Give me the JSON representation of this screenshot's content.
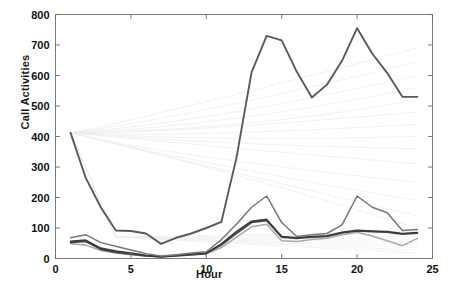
{
  "figure": {
    "ylabel": "Call Activities",
    "xlabel": "Hour",
    "caption": ""
  },
  "colors": {
    "axis": "#6b6b6b",
    "tick_text": "#111111",
    "main_curve": "#5a5a5a",
    "mid_curve": "#777777",
    "dark_low": "#3a3a3a",
    "light_low": "#a9a9a9",
    "background_lines": "#ededed",
    "plot_background": "#ffffff"
  },
  "chart_data": {
    "type": "line",
    "title": "",
    "xlabel": "Hour",
    "ylabel": "Call Activities",
    "xlim": [
      0,
      25
    ],
    "ylim": [
      0,
      800
    ],
    "xticks": [
      0,
      5,
      10,
      15,
      20,
      25
    ],
    "yticks": [
      0,
      100,
      200,
      300,
      400,
      500,
      600,
      700,
      800
    ],
    "grid": false,
    "legend": "none",
    "x": [
      1,
      2,
      3,
      4,
      5,
      6,
      7,
      8,
      9,
      10,
      11,
      12,
      13,
      14,
      15,
      16,
      17,
      18,
      19,
      20,
      21,
      22,
      23,
      24
    ],
    "series": [
      {
        "name": "dominant-cell",
        "color": "#5a5a5a",
        "width": 1.9,
        "values": [
          412,
          265,
          168,
          92,
          90,
          82,
          48,
          68,
          82,
          100,
          120,
          330,
          610,
          730,
          715,
          612,
          528,
          570,
          648,
          755,
          672,
          608,
          530,
          530
        ]
      },
      {
        "name": "secondary-cell",
        "color": "#777777",
        "width": 1.5,
        "values": [
          68,
          78,
          52,
          40,
          28,
          16,
          8,
          12,
          18,
          22,
          62,
          112,
          168,
          205,
          118,
          72,
          78,
          82,
          110,
          205,
          168,
          150,
          92,
          95
        ]
      },
      {
        "name": "third-cell",
        "color": "#3a3a3a",
        "width": 1.7,
        "values": [
          56,
          60,
          34,
          24,
          18,
          10,
          6,
          10,
          14,
          18,
          48,
          88,
          122,
          128,
          72,
          68,
          72,
          74,
          86,
          92,
          90,
          88,
          82,
          85
        ]
      },
      {
        "name": "fourth-cell",
        "color": "#4a4a4a",
        "width": 1.6,
        "values": [
          52,
          56,
          30,
          20,
          14,
          8,
          5,
          8,
          12,
          16,
          44,
          82,
          118,
          124,
          70,
          66,
          70,
          72,
          84,
          90,
          88,
          86,
          80,
          83
        ]
      },
      {
        "name": "fifth-cell",
        "color": "#a9a9a9",
        "width": 1.5,
        "values": [
          48,
          44,
          26,
          18,
          12,
          8,
          6,
          9,
          13,
          15,
          36,
          70,
          104,
          112,
          58,
          56,
          62,
          66,
          78,
          86,
          74,
          58,
          42,
          66
        ]
      }
    ],
    "background_series": {
      "name": "other-cells-faint",
      "color": "#ededed",
      "count": 14,
      "note": "faint lines fanning from hour 1 (~410) toward upper-right and low flat lines",
      "origin": {
        "x": 1,
        "y": 412
      },
      "endpoints": [
        {
          "x": 24,
          "y": 690
        },
        {
          "x": 24,
          "y": 645
        },
        {
          "x": 24,
          "y": 600
        },
        {
          "x": 24,
          "y": 560
        },
        {
          "x": 24,
          "y": 520
        },
        {
          "x": 24,
          "y": 480
        },
        {
          "x": 24,
          "y": 440
        },
        {
          "x": 24,
          "y": 400
        },
        {
          "x": 24,
          "y": 360
        },
        {
          "x": 24,
          "y": 310
        },
        {
          "x": 24,
          "y": 250
        },
        {
          "x": 24,
          "y": 190
        },
        {
          "x": 24,
          "y": 140
        },
        {
          "x": 24,
          "y": 100
        }
      ]
    }
  }
}
